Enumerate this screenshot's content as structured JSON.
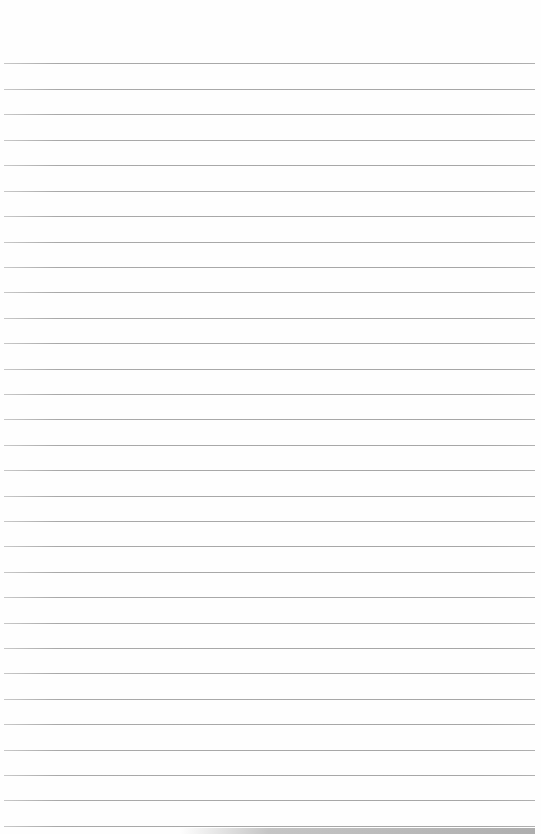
{
  "page": {
    "type": "lined-paper",
    "background_color": "#fefefe",
    "rule_color": "#a8a8a8",
    "rule_spacing_px": 25.4,
    "rule_count": 31,
    "rule_positions_y": [
      63,
      89,
      114,
      140,
      165,
      191,
      216,
      242,
      267,
      292,
      318,
      343,
      369,
      394,
      419,
      445,
      470,
      496,
      521,
      546,
      572,
      597,
      623,
      648,
      673,
      699,
      724,
      750,
      775,
      800,
      826
    ]
  }
}
